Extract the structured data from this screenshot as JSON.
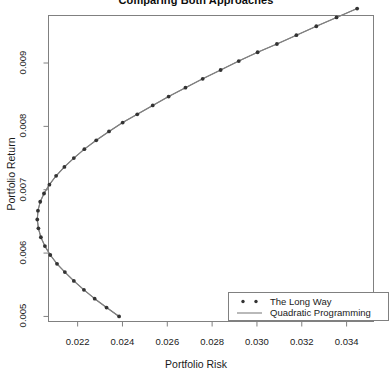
{
  "chart_data": {
    "type": "line",
    "title": "Comparing Both Approaches",
    "xlabel": "Portfolio Risk",
    "ylabel": "Portfolio Return",
    "xlim": [
      0.0207,
      0.0352
    ],
    "ylim": [
      0.00492,
      0.00975
    ],
    "grid": false,
    "xticks": [
      0.022,
      0.024,
      0.026,
      0.028,
      0.03,
      0.032,
      0.034
    ],
    "xtick_labels": [
      "0.022",
      "0.024",
      "0.026",
      "0.028",
      "0.030",
      "0.032",
      "0.034"
    ],
    "yticks": [
      0.005,
      0.006,
      0.007,
      0.008,
      0.009
    ],
    "ytick_labels": [
      "0.005",
      "0.006",
      "0.007",
      "0.008",
      "0.009"
    ],
    "legend_position": "bottom-right",
    "legend": [
      {
        "label": "The Long Way",
        "marker": "points",
        "color": "#333333"
      },
      {
        "label": "Quadratic Programming",
        "marker": "line",
        "color": "#7a7a7a"
      }
    ],
    "series": [
      {
        "name": "The Long Way",
        "marker": "points",
        "color": "#333333",
        "x": [
          0.02385,
          0.02329,
          0.02276,
          0.02228,
          0.02183,
          0.02143,
          0.02108,
          0.02078,
          0.02054,
          0.02036,
          0.02025,
          0.0202,
          0.02023,
          0.02033,
          0.0205,
          0.02074,
          0.02104,
          0.02141,
          0.02183,
          0.0223,
          0.02283,
          0.0234,
          0.02401,
          0.02466,
          0.02535,
          0.02606,
          0.02681,
          0.02758,
          0.02838,
          0.02919,
          0.03003,
          0.03089,
          0.03176,
          0.03265,
          0.03355,
          0.03447
        ],
        "y": [
          0.005,
          0.00514,
          0.00528,
          0.00542,
          0.00556,
          0.0057,
          0.00583,
          0.00597,
          0.00611,
          0.00625,
          0.00639,
          0.00653,
          0.00667,
          0.00681,
          0.00694,
          0.00708,
          0.00722,
          0.00736,
          0.0075,
          0.00764,
          0.00778,
          0.00792,
          0.00806,
          0.00819,
          0.00833,
          0.00847,
          0.00861,
          0.00875,
          0.00889,
          0.00903,
          0.00917,
          0.0093,
          0.00944,
          0.00958,
          0.00972,
          0.00986
        ]
      },
      {
        "name": "Quadratic Programming",
        "marker": "line",
        "color": "#7a7a7a",
        "x": [
          0.02385,
          0.02329,
          0.02276,
          0.02228,
          0.02183,
          0.02143,
          0.02108,
          0.02078,
          0.02054,
          0.02036,
          0.02025,
          0.0202,
          0.02023,
          0.02033,
          0.0205,
          0.02074,
          0.02104,
          0.02141,
          0.02183,
          0.0223,
          0.02283,
          0.0234,
          0.02401,
          0.02466,
          0.02535,
          0.02606,
          0.02681,
          0.02758,
          0.02838,
          0.02919,
          0.03003,
          0.03089,
          0.03176,
          0.03265,
          0.03355,
          0.03447
        ],
        "y": [
          0.005,
          0.00514,
          0.00528,
          0.00542,
          0.00556,
          0.0057,
          0.00583,
          0.00597,
          0.00611,
          0.00625,
          0.00639,
          0.00653,
          0.00667,
          0.00681,
          0.00694,
          0.00708,
          0.00722,
          0.00736,
          0.0075,
          0.00764,
          0.00778,
          0.00792,
          0.00806,
          0.00819,
          0.00833,
          0.00847,
          0.00861,
          0.00875,
          0.00889,
          0.00903,
          0.00917,
          0.0093,
          0.00944,
          0.00958,
          0.00972,
          0.00986
        ]
      }
    ]
  },
  "colors": {
    "frame": "#808080",
    "axis": "#808080",
    "point": "#333333",
    "line": "#808080",
    "text": "#1a1a1a",
    "background": "#ffffff"
  }
}
